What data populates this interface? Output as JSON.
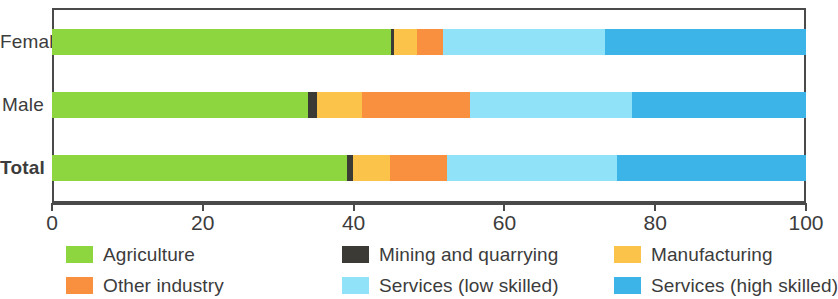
{
  "chart_data": {
    "type": "bar",
    "orientation": "horizontal",
    "stacked": true,
    "stacked_mode": "percent",
    "title": "",
    "xlabel": "",
    "ylabel": "",
    "xlim": [
      0,
      100
    ],
    "xticks": [
      0,
      20,
      40,
      60,
      80,
      100
    ],
    "xtick_labels": [
      "0",
      "20",
      "40",
      "60",
      "80",
      "100"
    ],
    "grid": false,
    "legend_position": "bottom",
    "categories": [
      "Female",
      "Male",
      "Total"
    ],
    "series": [
      {
        "name": "Agriculture",
        "color": "#8ed63f",
        "values": [
          45.0,
          33.9,
          39.1
        ]
      },
      {
        "name": "Mining and quarrying",
        "color": "#3b3a35",
        "values": [
          0.4,
          1.2,
          0.8
        ]
      },
      {
        "name": "Manufacturing",
        "color": "#fcc councils",
        "values": [
          3.0,
          6.0,
          4.9
        ]
      },
      {
        "name": "Other industry",
        "color": "#f89040",
        "values": [
          3.5,
          14.3,
          7.6
        ]
      },
      {
        "name": "Services (low skilled)",
        "color": "#8fe2f7",
        "values": [
          21.4,
          21.5,
          22.5
        ]
      },
      {
        "name": "Services (high skilled)",
        "color": "#3cb4e8",
        "values": [
          26.7,
          23.1,
          25.1
        ]
      }
    ],
    "axis_color": "#4a4a4a"
  },
  "legend": {
    "items": [
      {
        "label": "Agriculture",
        "color": "#8ed63f"
      },
      {
        "label": "Mining and quarrying",
        "color": "#3b3a35"
      },
      {
        "label": "Manufacturing",
        "color": "#fbc34a"
      },
      {
        "label": "Other industry",
        "color": "#f89040"
      },
      {
        "label": "Services (low skilled)",
        "color": "#8fe2f7"
      },
      {
        "label": "Services (high skilled)",
        "color": "#3cb4e8"
      }
    ],
    "order": [
      0,
      1,
      2,
      3,
      4,
      5
    ]
  },
  "colors": {
    "agriculture": "#8ed63f",
    "mining": "#3b3a35",
    "manufacturing": "#fbc34a",
    "other_industry": "#f89040",
    "services_low": "#8fe2f7",
    "services_high": "#3cb4e8",
    "axis": "#4a4a4a",
    "text": "#3c3c3c",
    "background": "#ffffff"
  },
  "layout": {
    "bold_categories": [
      "Total"
    ]
  }
}
